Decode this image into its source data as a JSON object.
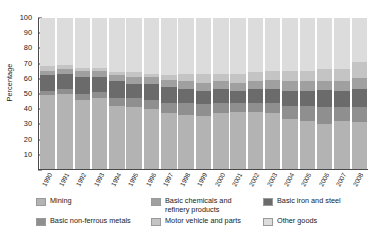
{
  "chart_data": {
    "type": "bar",
    "stacked": true,
    "title": "",
    "subtitle": "",
    "xlabel": "",
    "ylabel": "Percentage",
    "ylim": [
      0,
      100
    ],
    "yticks": [
      0,
      10,
      20,
      30,
      40,
      50,
      60,
      70,
      80,
      90,
      100
    ],
    "ytick_labels": [
      "",
      "10",
      "20",
      "30",
      "40",
      "50",
      "60",
      "70",
      "80",
      "90",
      "100"
    ],
    "grid": false,
    "legend_position": "bottom",
    "categories": [
      "1990",
      "1991",
      "1992",
      "1993",
      "1994",
      "1995",
      "1996",
      "1997",
      "1998",
      "1999",
      "2000",
      "2001",
      "2002",
      "2003",
      "2004",
      "2005",
      "2006",
      "2007",
      "2008"
    ],
    "series": [
      {
        "name": "Mining",
        "color": "#b3b3b3",
        "values": [
          49,
          50,
          46,
          47,
          42,
          41,
          40,
          37,
          36,
          35,
          37,
          38,
          38,
          37,
          33,
          32,
          30,
          32,
          31
        ]
      },
      {
        "name": "Basic non-ferrous metals",
        "color": "#8f8f8f",
        "values": [
          3,
          3,
          4,
          4,
          5,
          6,
          6,
          7,
          8,
          8,
          7,
          6,
          6,
          7,
          9,
          10,
          11,
          9,
          10
        ]
      },
      {
        "name": "Basic iron and steel",
        "color": "#6b6b6b",
        "values": [
          10,
          10,
          11,
          10,
          11,
          9,
          10,
          10,
          9,
          9,
          9,
          8,
          9,
          9,
          10,
          10,
          11,
          11,
          12
        ]
      },
      {
        "name": "Basic chemicals and refinery products",
        "color": "#a0a0a0",
        "values": [
          3,
          3,
          4,
          4,
          4,
          5,
          5,
          5,
          5,
          5,
          5,
          5,
          5,
          6,
          6,
          6,
          6,
          6,
          7
        ]
      },
      {
        "name": "Motor vehicle and parts",
        "color": "#c4c4c4",
        "values": [
          3,
          3,
          2,
          2,
          2,
          3,
          2,
          3,
          5,
          6,
          5,
          6,
          6,
          6,
          7,
          7,
          8,
          8,
          11
        ]
      },
      {
        "name": "Other goods",
        "color": "#dcdcdc",
        "values": [
          32,
          31,
          33,
          33,
          36,
          36,
          37,
          38,
          37,
          37,
          37,
          37,
          36,
          35,
          35,
          35,
          34,
          34,
          29
        ]
      }
    ]
  },
  "legend": {
    "items": [
      {
        "label": "Mining",
        "color": "#b3b3b3",
        "swatch_name": "legend-swatch-mining"
      },
      {
        "label": "Basic chemicals and\nrefinery products",
        "color": "#a0a0a0",
        "swatch_name": "legend-swatch-basic-chemicals"
      },
      {
        "label": "Basic iron and steel",
        "color": "#6b6b6b",
        "swatch_name": "legend-swatch-basic-iron-steel"
      },
      {
        "label": "Basic non-ferrous metals",
        "color": "#8f8f8f",
        "swatch_name": "legend-swatch-basic-non-ferrous"
      },
      {
        "label": "Motor vehicle and parts",
        "color": "#c4c4c4",
        "swatch_name": "legend-swatch-motor-vehicle"
      },
      {
        "label": "Other goods",
        "color": "#dcdcdc",
        "swatch_name": "legend-swatch-other-goods"
      }
    ]
  }
}
